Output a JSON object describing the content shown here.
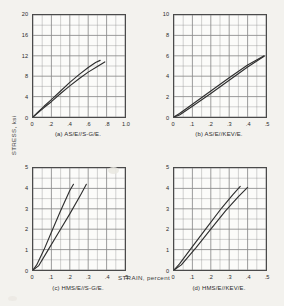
{
  "figure": {
    "axis_label_y": "STRESS, ksi",
    "axis_label_x": "STRAIN, percent",
    "grid_color": "#8a8a8a",
    "curve_color": "#2e2e2e",
    "frame_color": "#4a4a4a",
    "panel_bg": "#fbfbf9"
  },
  "chart_data": [
    {
      "type": "line",
      "panel": "a",
      "title": "(a) AS/E//S-G/E.",
      "xlabel": "STRAIN, percent",
      "ylabel": "STRESS, ksi",
      "xlim": [
        0,
        1.0
      ],
      "ylim": [
        0,
        20
      ],
      "xticks": [
        "0",
        ".2",
        ".4",
        ".6",
        ".8",
        "1.0"
      ],
      "xtick_values": [
        0,
        0.2,
        0.4,
        0.6,
        0.8,
        1.0
      ],
      "yticks": [
        "0",
        "4",
        "8",
        "12",
        "16",
        "20"
      ],
      "ytick_values": [
        0,
        4,
        8,
        12,
        16,
        20
      ],
      "x_minor_per_major": 2,
      "y_minor_per_major": 2,
      "grid": true,
      "legend": "none",
      "series": [
        {
          "name": "specimen 1",
          "x": [
            0.0,
            0.05,
            0.12,
            0.2,
            0.3,
            0.4,
            0.5,
            0.6,
            0.68,
            0.73
          ],
          "y": [
            0.0,
            0.9,
            2.1,
            3.4,
            5.1,
            6.8,
            8.3,
            9.7,
            10.7,
            11.1
          ]
        },
        {
          "name": "specimen 2",
          "x": [
            0.0,
            0.05,
            0.12,
            0.2,
            0.3,
            0.4,
            0.5,
            0.6,
            0.7,
            0.78
          ],
          "y": [
            0.0,
            0.75,
            1.85,
            3.0,
            4.6,
            6.1,
            7.5,
            8.8,
            9.9,
            10.8
          ]
        }
      ]
    },
    {
      "type": "line",
      "panel": "b",
      "title": "(b) AS/E//KEV/E.",
      "xlabel": "STRAIN, percent",
      "ylabel": "STRESS, ksi",
      "xlim": [
        0,
        0.5
      ],
      "ylim": [
        0,
        10
      ],
      "xticks": [
        "0",
        ".1",
        ".2",
        ".3",
        ".4",
        ".5"
      ],
      "xtick_values": [
        0,
        0.1,
        0.2,
        0.3,
        0.4,
        0.5
      ],
      "yticks": [
        "0",
        "2",
        "4",
        "6",
        "8",
        "10"
      ],
      "ytick_values": [
        0,
        2,
        4,
        6,
        8,
        10
      ],
      "x_minor_per_major": 2,
      "y_minor_per_major": 2,
      "grid": true,
      "legend": "none",
      "series": [
        {
          "name": "specimen 1",
          "x": [
            0.0,
            0.03,
            0.1,
            0.2,
            0.3,
            0.4,
            0.49
          ],
          "y": [
            0.0,
            0.35,
            1.25,
            2.55,
            3.85,
            5.1,
            6.0
          ]
        },
        {
          "name": "specimen 2",
          "x": [
            0.0,
            0.03,
            0.1,
            0.2,
            0.3,
            0.4,
            0.49
          ],
          "y": [
            0.0,
            0.2,
            1.05,
            2.3,
            3.6,
            4.9,
            5.95
          ]
        }
      ]
    },
    {
      "type": "line",
      "panel": "c",
      "title": "(c) HMS/E//S-G/E.",
      "xlabel": "STRAIN, percent",
      "ylabel": "STRESS, ksi",
      "xlim": [
        0,
        0.5
      ],
      "ylim": [
        0,
        5
      ],
      "xticks": [
        "0",
        ".1",
        ".2",
        ".3",
        ".4",
        ".5"
      ],
      "xtick_values": [
        0,
        0.1,
        0.2,
        0.3,
        0.4,
        0.5
      ],
      "yticks": [
        "0",
        "1",
        "2",
        "3",
        "4",
        "5"
      ],
      "ytick_values": [
        0,
        1,
        2,
        3,
        4,
        5
      ],
      "x_minor_per_major": 2,
      "y_minor_per_major": 2,
      "grid": true,
      "legend": "none",
      "series": [
        {
          "name": "specimen 1",
          "x": [
            0.0,
            0.02,
            0.06,
            0.1,
            0.15,
            0.2,
            0.22
          ],
          "y": [
            0.0,
            0.25,
            1.0,
            1.85,
            2.9,
            3.9,
            4.2
          ]
        },
        {
          "name": "specimen 2",
          "x": [
            0.0,
            0.03,
            0.08,
            0.14,
            0.2,
            0.26,
            0.29
          ],
          "y": [
            0.0,
            0.2,
            0.95,
            1.85,
            2.75,
            3.7,
            4.2
          ]
        }
      ]
    },
    {
      "type": "line",
      "panel": "d",
      "title": "(d) HMS/E//KEV/E.",
      "xlabel": "STRAIN, percent",
      "ylabel": "STRESS, ksi",
      "xlim": [
        0,
        0.5
      ],
      "ylim": [
        0,
        5
      ],
      "xticks": [
        "0",
        ".1",
        ".2",
        ".3",
        ".4",
        ".5"
      ],
      "xtick_values": [
        0,
        0.1,
        0.2,
        0.3,
        0.4,
        0.5
      ],
      "yticks": [
        "0",
        "1",
        "2",
        "3",
        "4",
        "5"
      ],
      "ytick_values": [
        0,
        1,
        2,
        3,
        4,
        5
      ],
      "x_minor_per_major": 2,
      "y_minor_per_major": 2,
      "grid": true,
      "legend": "none",
      "series": [
        {
          "name": "specimen 1",
          "x": [
            0.0,
            0.03,
            0.1,
            0.18,
            0.26,
            0.32,
            0.36
          ],
          "y": [
            0.0,
            0.3,
            1.15,
            2.1,
            3.05,
            3.7,
            4.1
          ]
        },
        {
          "name": "specimen 2",
          "x": [
            0.0,
            0.04,
            0.12,
            0.2,
            0.28,
            0.35,
            0.4
          ],
          "y": [
            0.0,
            0.25,
            1.1,
            2.0,
            2.9,
            3.6,
            4.05
          ]
        }
      ]
    }
  ]
}
